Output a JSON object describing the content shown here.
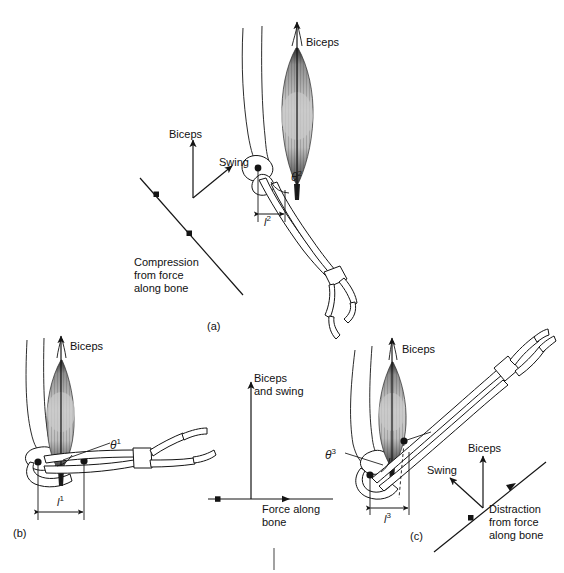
{
  "figure": {
    "background": "#ffffff",
    "ink_color": "#141414",
    "muscle_fill": "#b9b9b9",
    "panel_ids": {
      "a": "(a)",
      "b": "(b)",
      "c": "(c)"
    }
  },
  "panels": [
    {
      "id": "a",
      "id_label": "(a)",
      "vector_diagram": {
        "labels": {
          "biceps": "Biceps",
          "swing": "Swing",
          "force": "Compression\nfrom force\nalong bone"
        },
        "vectors": [
          {
            "name": "biceps",
            "direction": "up",
            "label": "Biceps"
          },
          {
            "name": "swing",
            "direction": "up-right",
            "label": "Swing"
          },
          {
            "name": "bone-force",
            "direction": "down-right-diagonal",
            "label": "Compression from force along bone"
          }
        ]
      },
      "arm": {
        "angle_label": "θ",
        "angle_superscript": "2",
        "moment_arm_label": "l",
        "moment_arm_superscript": "2",
        "muscle_label": "Biceps",
        "elbow_state": "extended-oblique"
      }
    },
    {
      "id": "b",
      "id_label": "(b)",
      "vector_diagram": {
        "labels": {
          "biceps_and_swing": "Biceps\nand swing",
          "force": "Force along\nbone"
        },
        "vectors": [
          {
            "name": "biceps-and-swing",
            "direction": "up",
            "label": "Biceps and swing"
          },
          {
            "name": "bone-force",
            "direction": "horizontal",
            "label": "Force along bone"
          }
        ]
      },
      "arm": {
        "angle_label": "θ",
        "angle_superscript": "1",
        "moment_arm_label": "l",
        "moment_arm_superscript": "1",
        "muscle_label": "Biceps",
        "elbow_state": "right-angle-horizontal-forearm"
      }
    },
    {
      "id": "c",
      "id_label": "(c)",
      "vector_diagram": {
        "labels": {
          "biceps": "Biceps",
          "swing": "Swing",
          "force": "Distraction\nfrom force\nalong bone"
        },
        "vectors": [
          {
            "name": "biceps",
            "direction": "up",
            "label": "Biceps"
          },
          {
            "name": "swing",
            "direction": "up-left",
            "label": "Swing"
          },
          {
            "name": "bone-force",
            "direction": "up-right-diagonal",
            "label": "Distraction from force along bone"
          }
        ]
      },
      "arm": {
        "angle_label": "θ",
        "angle_superscript": "3",
        "moment_arm_label": "l",
        "moment_arm_superscript": "3",
        "muscle_label": "Biceps",
        "elbow_state": "flexed"
      }
    }
  ],
  "text_items": {
    "a_biceps": "Biceps",
    "a_swing": "Swing",
    "a_force_l1": "Compression",
    "a_force_l2": "from force",
    "a_force_l3": "along bone",
    "a_arm_biceps": "Biceps",
    "a_theta": "θ",
    "a_theta_sup": "2",
    "a_len": "l",
    "a_len_sup": "2",
    "a_panel": "(a)",
    "b_arm_biceps": "Biceps",
    "b_theta": "θ",
    "b_theta_sup": "1",
    "b_len": "l",
    "b_len_sup": "1",
    "b_vec_l1": "Biceps",
    "b_vec_l2": "and swing",
    "b_force_l1": "Force along",
    "b_force_l2": "bone",
    "b_panel": "(b)",
    "c_arm_biceps": "Biceps",
    "c_theta": "θ",
    "c_theta_sup": "3",
    "c_len": "l",
    "c_len_sup": "3",
    "c_vec_biceps": "Biceps",
    "c_vec_swing": "Swing",
    "c_force_l1": "Distraction",
    "c_force_l2": "from force",
    "c_force_l3": "along bone",
    "c_panel": "(c)"
  }
}
